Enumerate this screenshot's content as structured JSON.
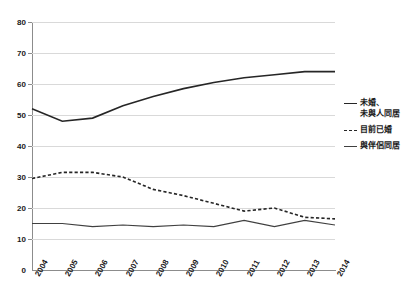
{
  "chart_data": {
    "type": "line",
    "title": "",
    "subtitle": "",
    "xlabel": "",
    "ylabel": "",
    "xlim": [
      2004,
      2014
    ],
    "ylim": [
      0,
      80
    ],
    "ytick_step": 10,
    "grid": true,
    "legend_position": "right",
    "categories": [
      "2004",
      "2005",
      "2006",
      "2007",
      "2008",
      "2009",
      "2010",
      "2011",
      "2012",
      "2013",
      "2014"
    ],
    "yticks": [
      "0",
      "10",
      "20",
      "30",
      "40",
      "50",
      "60",
      "70",
      "80"
    ],
    "series": [
      {
        "name": "未婚、未與人同居",
        "style": "solid",
        "color": "#262626",
        "values": [
          52,
          48,
          49,
          53,
          56,
          58.5,
          60.5,
          62,
          63,
          64,
          64
        ]
      },
      {
        "name": "目前已婚",
        "style": "dashed",
        "color": "#262626",
        "values": [
          29.5,
          31.5,
          31.5,
          30,
          26,
          24,
          21.5,
          19,
          20,
          17,
          16.5
        ]
      },
      {
        "name": "與伴侶同居",
        "style": "thin-solid",
        "color": "#404040",
        "values": [
          15,
          15,
          14,
          14.5,
          14,
          14.5,
          14,
          16,
          14,
          16,
          14.5
        ]
      }
    ]
  },
  "legend": {
    "items": [
      {
        "label_line1": "未婚、",
        "label_line2": "未與人同居",
        "style": "solid"
      },
      {
        "label_line1": "目前已婚",
        "label_line2": "",
        "style": "dashed"
      },
      {
        "label_line1": "與伴侶同居",
        "label_line2": "",
        "style": "thin"
      }
    ]
  }
}
